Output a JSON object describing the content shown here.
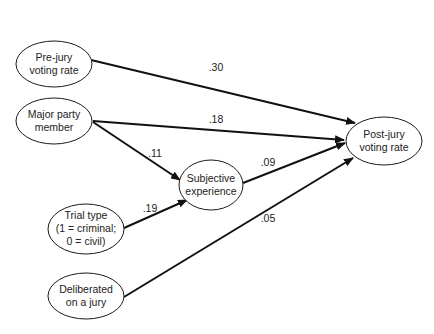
{
  "diagram": {
    "type": "path_diagram",
    "colors": {
      "line": "#111111",
      "node_border": "#1a1a1a",
      "text": "#222222",
      "background": "#ffffff"
    },
    "nodes": {
      "pre_jury": {
        "line1": "Pre-jury",
        "line2": "voting rate"
      },
      "major_party": {
        "line1": "Major party",
        "line2": "member"
      },
      "trial_type": {
        "line1": "Trial type",
        "line2": "(1 = criminal;",
        "line3": "0 = civil)"
      },
      "deliberated": {
        "line1": "Deliberated",
        "line2": "on a jury"
      },
      "subjective": {
        "line1": "Subjective",
        "line2": "experience"
      },
      "post_jury": {
        "line1": "Post-jury",
        "line2": "voting rate"
      }
    },
    "edges": {
      "pre_to_post": {
        "from": "Pre-jury voting rate",
        "to": "Post-jury voting rate",
        "label": ".30"
      },
      "party_to_post": {
        "from": "Major party member",
        "to": "Post-jury voting rate",
        "label": ".18"
      },
      "party_to_subj": {
        "from": "Major party member",
        "to": "Subjective experience",
        "label": ".11"
      },
      "trial_to_subj": {
        "from": "Trial type",
        "to": "Subjective experience",
        "label": ".19"
      },
      "subj_to_post": {
        "from": "Subjective experience",
        "to": "Post-jury voting rate",
        "label": ".09"
      },
      "delib_to_post": {
        "from": "Deliberated on a jury",
        "to": "Post-jury voting rate",
        "label": ".05"
      }
    }
  }
}
